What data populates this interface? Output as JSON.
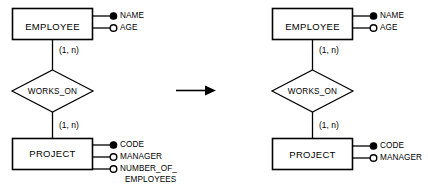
{
  "figure": {
    "background_color": "#ffffff",
    "line_color": "#000000",
    "transform_arrow": "arrow-right"
  },
  "diagrams": [
    {
      "id": "before",
      "entities": [
        {
          "name": "EMPLOYEE",
          "attributes": [
            {
              "label": "NAME",
              "key": true
            },
            {
              "label": "AGE",
              "key": false
            }
          ]
        },
        {
          "name": "PROJECT",
          "attributes": [
            {
              "label": "CODE",
              "key": true
            },
            {
              "label": "MANAGER",
              "key": false
            },
            {
              "label": "NUMBER_OF_",
              "label2": "EMPLOYEES",
              "key": false
            }
          ]
        }
      ],
      "relationship": {
        "name": "WORKS_ON",
        "upper_cardinality": "(1, n)",
        "lower_cardinality": "(1, n)"
      }
    },
    {
      "id": "after",
      "entities": [
        {
          "name": "EMPLOYEE",
          "attributes": [
            {
              "label": "NAME",
              "key": true
            },
            {
              "label": "AGE",
              "key": false
            }
          ]
        },
        {
          "name": "PROJECT",
          "attributes": [
            {
              "label": "CODE",
              "key": true
            },
            {
              "label": "MANAGER",
              "key": false
            }
          ]
        }
      ],
      "relationship": {
        "name": "WORKS_ON",
        "upper_cardinality": "(1, n)",
        "lower_cardinality": "(1, n)"
      }
    }
  ]
}
